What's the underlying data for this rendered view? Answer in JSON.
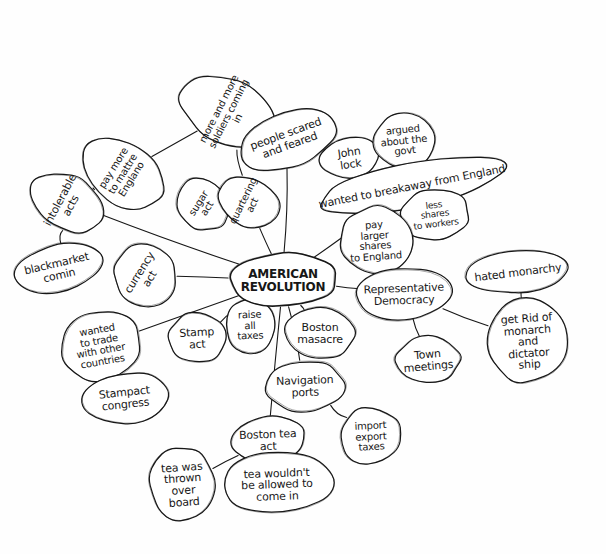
{
  "document": {
    "type": "hand-drawn-mind-map",
    "title": "AMERICAN REVOLUTION",
    "medium": "pen on white paper",
    "ink_color": "#171717",
    "paper_color": "#fefefe",
    "width": 606,
    "height": 554
  },
  "central_node": {
    "id": "american-revolution",
    "label": "AMERICAN\nREVOLUTION",
    "x": 283,
    "y": 280,
    "w": 96,
    "h": 40,
    "rotation": 0,
    "font_size": 12
  },
  "nodes": [
    {
      "id": "intolerable-acts",
      "label": "intolerable\nacts",
      "x": 66,
      "y": 202,
      "w": 42,
      "h": 64,
      "rotation": -62,
      "font_size": 11
    },
    {
      "id": "pay-more-to-england",
      "label": "pay more\nto mattre\nEnglano",
      "x": 123,
      "y": 173,
      "w": 48,
      "h": 80,
      "rotation": -58,
      "font_size": 10
    },
    {
      "id": "blackmarket-comin",
      "label": "blackmarket\ncomin",
      "x": 58,
      "y": 269,
      "w": 78,
      "h": 34,
      "rotation": -13,
      "font_size": 11
    },
    {
      "id": "currency-act",
      "label": "currency\nact",
      "x": 145,
      "y": 275,
      "w": 46,
      "h": 52,
      "rotation": -58,
      "font_size": 11
    },
    {
      "id": "more-soldiers",
      "label": "more and more\nsoldiers coming in",
      "x": 229,
      "y": 113,
      "w": 52,
      "h": 92,
      "rotation": -63,
      "font_size": 10
    },
    {
      "id": "people-scared",
      "label": "people scared\nand feared",
      "x": 288,
      "y": 139,
      "w": 92,
      "h": 42,
      "rotation": -20,
      "font_size": 11
    },
    {
      "id": "sugar-act",
      "label": "sugar\nact",
      "x": 203,
      "y": 205,
      "w": 36,
      "h": 44,
      "rotation": -58,
      "font_size": 10
    },
    {
      "id": "quartering-act",
      "label": "quartering\nact",
      "x": 248,
      "y": 202,
      "w": 36,
      "h": 52,
      "rotation": -64,
      "font_size": 10
    },
    {
      "id": "john-lock",
      "label": "John\nlock",
      "x": 350,
      "y": 158,
      "w": 48,
      "h": 28,
      "rotation": -8,
      "font_size": 11
    },
    {
      "id": "argued-about-govt",
      "label": "argued\nabout the\ngovt",
      "x": 404,
      "y": 140,
      "w": 50,
      "h": 42,
      "rotation": -6,
      "font_size": 10
    },
    {
      "id": "break-away-england",
      "label": "wanted to breakaway from England",
      "x": 412,
      "y": 186,
      "w": 180,
      "h": 32,
      "rotation": -11,
      "font_size": 11
    },
    {
      "id": "less-shares-workers",
      "label": "less\nshares\nto workers",
      "x": 435,
      "y": 214,
      "w": 56,
      "h": 38,
      "rotation": -7,
      "font_size": 9
    },
    {
      "id": "pay-larger-shares",
      "label": "pay\nlarger\nshares\nto England",
      "x": 375,
      "y": 240,
      "w": 60,
      "h": 54,
      "rotation": -4,
      "font_size": 10
    },
    {
      "id": "wanted-to-trade",
      "label": "wanted\nto trade\nwith other\ncountries",
      "x": 100,
      "y": 345,
      "w": 70,
      "h": 58,
      "rotation": -10,
      "font_size": 10
    },
    {
      "id": "stamp-act",
      "label": "Stamp\nact",
      "x": 197,
      "y": 338,
      "w": 44,
      "h": 38,
      "rotation": -3,
      "font_size": 11
    },
    {
      "id": "raise-all-taxes",
      "label": "raise\nall\ntaxes",
      "x": 250,
      "y": 325,
      "w": 36,
      "h": 42,
      "rotation": -2,
      "font_size": 10
    },
    {
      "id": "stampact-congress",
      "label": "Stampact\ncongress",
      "x": 125,
      "y": 398,
      "w": 72,
      "h": 38,
      "rotation": -6,
      "font_size": 11
    },
    {
      "id": "boston-masacre",
      "label": "Boston\nmasacre",
      "x": 320,
      "y": 333,
      "w": 56,
      "h": 38,
      "rotation": 0,
      "font_size": 11
    },
    {
      "id": "representative-democracy",
      "label": "Representative\nDemocracy",
      "x": 404,
      "y": 294,
      "w": 84,
      "h": 38,
      "rotation": -2,
      "font_size": 11
    },
    {
      "id": "town-meetings",
      "label": "Town\nmeetings",
      "x": 428,
      "y": 360,
      "w": 52,
      "h": 34,
      "rotation": -5,
      "font_size": 11
    },
    {
      "id": "hated-monarchy",
      "label": "hated monarchy",
      "x": 518,
      "y": 272,
      "w": 96,
      "h": 28,
      "rotation": -7,
      "font_size": 11
    },
    {
      "id": "get-rid-of-monarch",
      "label": "get Rid of\nmonarch\nand\ndictator\nship",
      "x": 528,
      "y": 341,
      "w": 72,
      "h": 70,
      "rotation": -4,
      "font_size": 11
    },
    {
      "id": "navigation-ports",
      "label": "Navigation\nports",
      "x": 305,
      "y": 386,
      "w": 66,
      "h": 38,
      "rotation": -2,
      "font_size": 11
    },
    {
      "id": "import-export-taxes",
      "label": "import\nexport\ntaxes",
      "x": 371,
      "y": 436,
      "w": 50,
      "h": 44,
      "rotation": -3,
      "font_size": 10
    },
    {
      "id": "boston-tea-act",
      "label": "Boston tea\nact",
      "x": 268,
      "y": 440,
      "w": 62,
      "h": 34,
      "rotation": -2,
      "font_size": 11
    },
    {
      "id": "tea-thrown-overboard",
      "label": "tea was\nthrown\nover\nboard",
      "x": 183,
      "y": 484,
      "w": 52,
      "h": 62,
      "rotation": -4,
      "font_size": 11
    },
    {
      "id": "tea-not-allowed",
      "label": "tea wouldn't\nbe allowed to\ncome in",
      "x": 277,
      "y": 484,
      "w": 100,
      "h": 48,
      "rotation": -2,
      "font_size": 11
    }
  ],
  "edges": [
    {
      "from": "american-revolution",
      "to": "intolerable-acts"
    },
    {
      "from": "intolerable-acts",
      "to": "pay-more-to-england"
    },
    {
      "from": "intolerable-acts",
      "to": "blackmarket-comin"
    },
    {
      "from": "american-revolution",
      "to": "currency-act"
    },
    {
      "from": "pay-more-to-england",
      "to": "more-soldiers"
    },
    {
      "from": "american-revolution",
      "to": "quartering-act"
    },
    {
      "from": "quartering-act",
      "to": "sugar-act"
    },
    {
      "from": "quartering-act",
      "to": "more-soldiers"
    },
    {
      "from": "american-revolution",
      "to": "people-scared"
    },
    {
      "from": "people-scared",
      "to": "john-lock"
    },
    {
      "from": "john-lock",
      "to": "argued-about-govt"
    },
    {
      "from": "american-revolution",
      "to": "break-away-england"
    },
    {
      "from": "break-away-england",
      "to": "less-shares-workers"
    },
    {
      "from": "break-away-england",
      "to": "pay-larger-shares"
    },
    {
      "from": "american-revolution",
      "to": "wanted-to-trade"
    },
    {
      "from": "wanted-to-trade",
      "to": "stampact-congress"
    },
    {
      "from": "american-revolution",
      "to": "stamp-act"
    },
    {
      "from": "american-revolution",
      "to": "raise-all-taxes"
    },
    {
      "from": "american-revolution",
      "to": "boston-masacre"
    },
    {
      "from": "american-revolution",
      "to": "representative-democracy"
    },
    {
      "from": "representative-democracy",
      "to": "town-meetings"
    },
    {
      "from": "representative-democracy",
      "to": "get-rid-of-monarch"
    },
    {
      "from": "get-rid-of-monarch",
      "to": "hated-monarchy"
    },
    {
      "from": "american-revolution",
      "to": "navigation-ports"
    },
    {
      "from": "navigation-ports",
      "to": "import-export-taxes"
    },
    {
      "from": "american-revolution",
      "to": "boston-tea-act"
    },
    {
      "from": "boston-tea-act",
      "to": "tea-thrown-overboard"
    },
    {
      "from": "boston-tea-act",
      "to": "tea-not-allowed"
    }
  ]
}
